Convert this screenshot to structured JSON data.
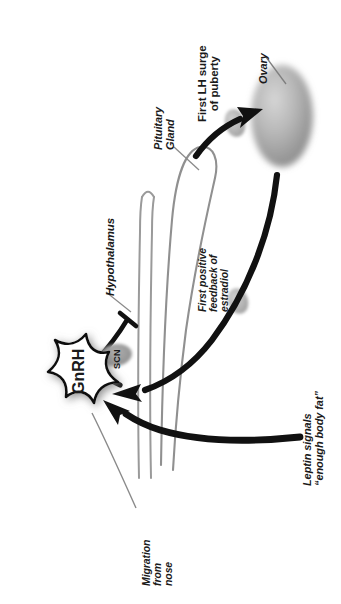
{
  "figure": {
    "orientation": "rotated-90-ccw",
    "background_color": "#ffffff"
  },
  "labels": {
    "hypothalamus": "Hypothalamus",
    "pituitary_gland": [
      "Pituitary",
      "Gland"
    ],
    "first_lh_surge": [
      "First LH surge",
      "of puberty"
    ],
    "ovary": "Ovary",
    "first_positive_feedback": [
      "First positive",
      "feedback of",
      "estradiol"
    ],
    "leptin_signals": [
      "Leptin signals",
      "“enough body fat”"
    ],
    "migration_from_nose": [
      "Migration",
      "from",
      "nose"
    ],
    "gnrh": "GnRH",
    "scn": "SCN"
  },
  "colors": {
    "text": "#1a1a1a",
    "arrow": "#111111",
    "outline_gray": "#8f8f8f",
    "leader_gray": "#7a7a7a",
    "ovary_fill_light": "#cfcfcf",
    "ovary_fill_dark": "#8c8c8c",
    "scn_fill": "#9a9a9a",
    "burst_fill": "#ffffff",
    "burst_stroke": "#111111"
  }
}
